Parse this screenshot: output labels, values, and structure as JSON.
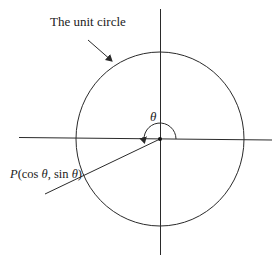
{
  "diagram": {
    "title_label": "The unit circle",
    "theta_label": "θ",
    "point_label": {
      "prefix": "P",
      "open": "(cos ",
      "theta1": "θ",
      "mid": ", sin ",
      "theta2": "θ",
      "close": ")"
    },
    "colors": {
      "stroke": "#2a2a2a",
      "background": "#ffffff"
    }
  }
}
